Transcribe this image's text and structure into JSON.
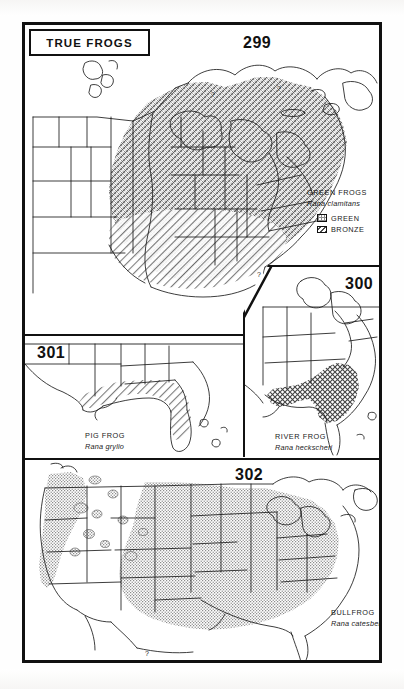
{
  "plate": {
    "title": "TRUE FROGS",
    "group_note": "Plate of four range maps of North American true frogs (family Ranidae)"
  },
  "legend": {
    "title": "GREEN FROGS",
    "scientific_name": "Rana clamitans",
    "items": [
      {
        "label": "GREEN",
        "pattern": "stipple"
      },
      {
        "label": "BRONZE",
        "pattern": "diagonal-hatch"
      }
    ]
  },
  "maps": [
    {
      "number": "299",
      "common_name": "GREEN FROGS",
      "scientific_name": "Rana clamitans",
      "region": "Eastern and central North America",
      "patterns": [
        "stipple",
        "diagonal-hatch"
      ]
    },
    {
      "number": "300",
      "common_name": "RIVER FROG",
      "scientific_name": "Rana heckscheri",
      "region": "Southeastern coastal plain",
      "patterns": [
        "cross-hatch"
      ]
    },
    {
      "number": "301",
      "common_name": "PIG FROG",
      "scientific_name": "Rana grylio",
      "region": "Gulf coastal plain and Florida",
      "patterns": [
        "diagonal-hatch"
      ]
    },
    {
      "number": "302",
      "common_name": "BULLFROG",
      "scientific_name": "Rana catesbeiana",
      "region": "Most of the United States and southern Canada",
      "patterns": [
        "stipple"
      ]
    }
  ],
  "annotations": {
    "query_marks": [
      "?",
      "?",
      "?",
      "?"
    ]
  },
  "colors": {
    "ink": "#111111",
    "paper": "#ffffff",
    "fill_gray": "#b9b9b9"
  }
}
